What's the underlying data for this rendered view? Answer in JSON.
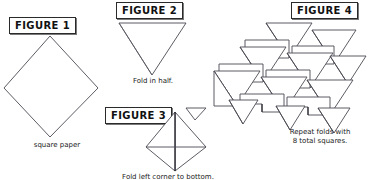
{
  "document": {
    "type": "origami-instruction-diagram",
    "background_color": "#ffffff",
    "line_color": "#4a4a52",
    "text_color": "#1a1a1a"
  },
  "panels": [
    {
      "id": "figure-1",
      "label": "FIGURE 1",
      "caption": "square paper",
      "shape": "diamond"
    },
    {
      "id": "figure-2",
      "label": "FIGURE 2",
      "caption": "Fold in half.",
      "shape": "triangle-down"
    },
    {
      "id": "figure-3",
      "label": "FIGURE 3",
      "caption": "Fold left corner to bottom.",
      "shape": "folded-triangle"
    },
    {
      "id": "figure-4",
      "label": "FIGURE 4",
      "caption_line1": "Repeat folds with",
      "caption_line2": "8 total squares.",
      "shape": "assembled-cluster",
      "unit_count": "8"
    }
  ]
}
